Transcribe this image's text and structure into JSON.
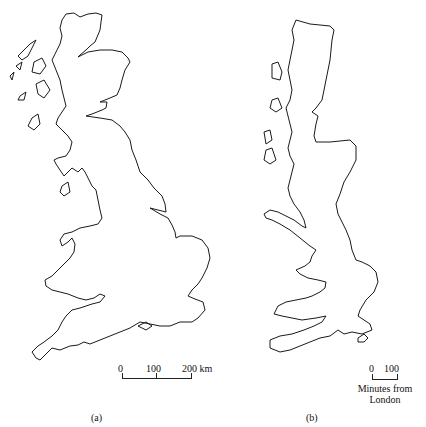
{
  "figure": {
    "panel_a": {
      "caption": "(a)",
      "description": "Outline map of Great Britain in geographic distance",
      "scale": {
        "ticks": [
          "0",
          "100",
          "200 km"
        ]
      }
    },
    "panel_b": {
      "caption": "(b)",
      "description": "Outline map of Great Britain distorted by travel time from London",
      "scale": {
        "ticks": [
          "0",
          "100"
        ],
        "unit_line1": "Minutes from",
        "unit_line2": "London"
      }
    }
  }
}
